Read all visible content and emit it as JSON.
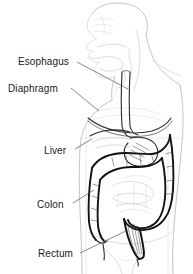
{
  "figure": {
    "background_color": "#ffffff",
    "label_color": "#1a1a1a",
    "leader_line_color": "#565656",
    "organ_line_color": "#121212",
    "body_outline_color": "#b9b9bd",
    "labels": [
      {
        "id": "esophagus",
        "text": "Esophagus",
        "x": 18,
        "y": 65
      },
      {
        "id": "diaphragm",
        "text": "Diaphragm",
        "x": 8,
        "y": 92
      },
      {
        "id": "liver",
        "text": "Liver",
        "x": 44,
        "y": 154
      },
      {
        "id": "colon",
        "text": "Colon",
        "x": 37,
        "y": 208
      },
      {
        "id": "rectum",
        "text": "Rectum",
        "x": 38,
        "y": 257
      }
    ],
    "leaders": [
      {
        "id": "esophagus-leader",
        "d": "M 77 62 L 128 89"
      },
      {
        "id": "diaphragm-leader",
        "d": "M 71 88 L 99 111"
      },
      {
        "id": "liver-leader",
        "d": "M 75 149 L 92 139"
      },
      {
        "id": "colon-leader",
        "d": "M 73 203 L 94 190"
      },
      {
        "id": "rectum-leader",
        "d": "M 80 253 L 128 230"
      }
    ]
  }
}
